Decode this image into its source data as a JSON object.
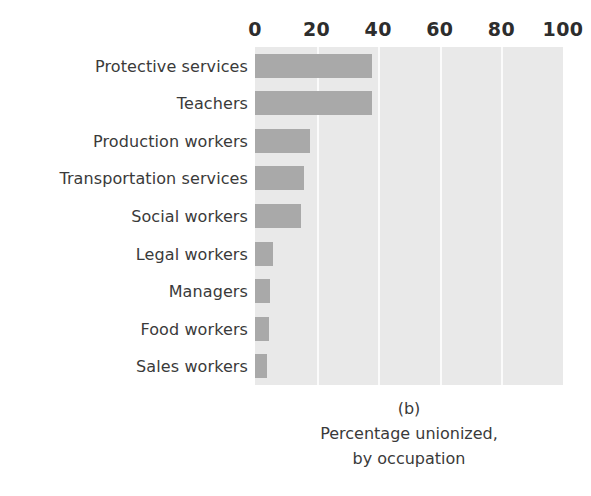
{
  "figure": {
    "clipped_top_text": "",
    "panel_label": "(b)",
    "caption_line1": "Percentage unionized,",
    "caption_line2": "by occupation"
  },
  "colors": {
    "bar": "#a9a9a9",
    "plot_background": "#e9e9e9",
    "gridline": "#fbfbfb",
    "text": "#3a3a3a",
    "tick_text": "#2d2d2d",
    "page_background": "#ffffff"
  },
  "chart_data": {
    "type": "bar",
    "orientation": "horizontal",
    "title": "(b) Percentage unionized, by occupation",
    "xlabel": "",
    "ylabel": "",
    "xlim": [
      0,
      100
    ],
    "xticks": [
      0,
      20,
      40,
      60,
      80,
      100
    ],
    "xticklabels": [
      "0",
      "20",
      "40",
      "60",
      "80",
      "100"
    ],
    "grid": "vertical gridlines at 20, 40, 60, 80",
    "gridlines": [
      20,
      40,
      60,
      80
    ],
    "legend": null,
    "categories": [
      "Protective services",
      "Teachers",
      "Production workers",
      "Transportation services",
      "Social workers",
      "Legal workers",
      "Managers",
      "Food workers",
      "Sales workers"
    ],
    "values": [
      38,
      38,
      18,
      16,
      15,
      6,
      5,
      4.5,
      4
    ],
    "series": [
      {
        "name": "Percentage unionized",
        "values": [
          38,
          38,
          18,
          16,
          15,
          6,
          5,
          4.5,
          4
        ]
      }
    ]
  }
}
